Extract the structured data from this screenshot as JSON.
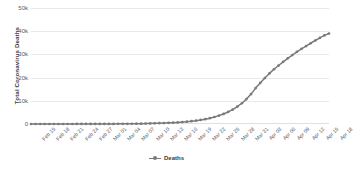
{
  "chart_data": {
    "type": "line",
    "title": "",
    "xlabel": "",
    "ylabel": "Total Coronavirus Deaths",
    "ylim": [
      0,
      50000
    ],
    "yticks": [
      "0",
      "10k",
      "20k",
      "30k",
      "40k",
      "50k"
    ],
    "ytick_values": [
      0,
      10000,
      20000,
      30000,
      40000,
      50000
    ],
    "grid": true,
    "legend_position": "bottom",
    "series": [
      {
        "name": "Deaths",
        "color": "#7a7a7a",
        "marker": "circle",
        "values": [
          1,
          1,
          2,
          2,
          3,
          3,
          4,
          5,
          7,
          9,
          11,
          14,
          17,
          21,
          26,
          30,
          36,
          43,
          52,
          63,
          76,
          92,
          110,
          133,
          160,
          193,
          233,
          280,
          336,
          404,
          485,
          582,
          700,
          840,
          1010,
          1210,
          1450,
          1740,
          2090,
          2510,
          3010,
          3610,
          4330,
          5190,
          6220,
          7460,
          8950,
          10740,
          12890,
          15470,
          17700,
          19800,
          21800,
          23600,
          25200,
          26800,
          28300,
          29700,
          31100,
          32400,
          33600,
          34800,
          36000,
          37100,
          38200,
          39000
        ]
      }
    ],
    "categories": [
      "Feb 15",
      "Feb 16",
      "Feb 17",
      "Feb 18",
      "Feb 19",
      "Feb 20",
      "Feb 21",
      "Feb 22",
      "Feb 23",
      "Feb 24",
      "Feb 25",
      "Feb 26",
      "Feb 27",
      "Feb 28",
      "Feb 29",
      "Mar 01",
      "Mar 02",
      "Mar 03",
      "Mar 04",
      "Mar 05",
      "Mar 06",
      "Mar 07",
      "Mar 08",
      "Mar 09",
      "Mar 10",
      "Mar 11",
      "Mar 12",
      "Mar 13",
      "Mar 14",
      "Mar 15",
      "Mar 16",
      "Mar 17",
      "Mar 18",
      "Mar 19",
      "Mar 20",
      "Mar 21",
      "Mar 22",
      "Mar 23",
      "Mar 24",
      "Mar 25",
      "Mar 26",
      "Mar 27",
      "Mar 28",
      "Mar 29",
      "Mar 30",
      "Mar 31",
      "Apr 01",
      "Apr 02",
      "Apr 03",
      "Apr 04",
      "Apr 05",
      "Apr 06",
      "Apr 07",
      "Apr 08",
      "Apr 09",
      "Apr 10",
      "Apr 11",
      "Apr 12",
      "Apr 13",
      "Apr 14",
      "Apr 15",
      "Apr 16",
      "Apr 17",
      "Apr 18",
      "Apr 19",
      "Apr 20"
    ],
    "xtick_labels": [
      "Feb 15",
      "Feb 18",
      "Feb 21",
      "Feb 24",
      "Feb 27",
      "Mar 01",
      "Mar 04",
      "Mar 07",
      "Mar 10",
      "Mar 13",
      "Mar 16",
      "Mar 19",
      "Mar 22",
      "Mar 25",
      "Mar 28",
      "Mar 31",
      "Apr 03",
      "Apr 06",
      "Apr 09",
      "Apr 12",
      "Apr 15",
      "Apr 18"
    ]
  },
  "legend": {
    "entry_label": "Deaths"
  }
}
